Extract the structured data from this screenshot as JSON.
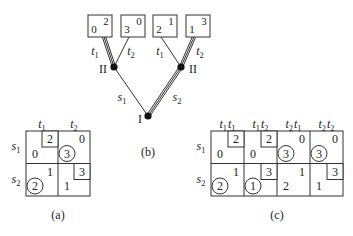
{
  "tree": {
    "caption": "(b)",
    "root": {
      "player": "I",
      "actions": [
        "s1",
        "s2"
      ],
      "chosen": "s2"
    },
    "nodes": [
      {
        "player": "II",
        "after": "s1",
        "actions": [
          "t1",
          "t2"
        ],
        "chosen": "t1",
        "payoffs": [
          {
            "p1": "0",
            "p2": "2"
          },
          {
            "p1": "3",
            "p2": "0"
          }
        ]
      },
      {
        "player": "II",
        "after": "s2",
        "actions": [
          "t1",
          "t2"
        ],
        "chosen": "t2",
        "payoffs": [
          {
            "p1": "2",
            "p2": "1"
          },
          {
            "p1": "1",
            "p2": "3"
          }
        ]
      }
    ]
  },
  "matrix_a": {
    "caption": "(a)",
    "col_headers": [
      "t1",
      "t2"
    ],
    "row_headers": [
      "s1",
      "s2"
    ],
    "cells": [
      [
        {
          "p1": "0",
          "p2": "2",
          "p1_circled": false,
          "p2_boxed": true
        },
        {
          "p1": "3",
          "p2": "0",
          "p1_circled": true,
          "p2_boxed": false
        }
      ],
      [
        {
          "p1": "2",
          "p2": "1",
          "p1_circled": true,
          "p2_boxed": false
        },
        {
          "p1": "1",
          "p2": "3",
          "p1_circled": false,
          "p2_boxed": true
        }
      ]
    ]
  },
  "matrix_c": {
    "caption": "(c)",
    "col_headers": [
      "t1t1",
      "t1t2",
      "t2t1",
      "t2t2"
    ],
    "row_headers": [
      "s1",
      "s2"
    ],
    "cells": [
      [
        {
          "p1": "0",
          "p2": "2",
          "p1_circled": false,
          "p2_boxed": true
        },
        {
          "p1": "0",
          "p2": "2",
          "p1_circled": false,
          "p2_boxed": true
        },
        {
          "p1": "3",
          "p2": "0",
          "p1_circled": true,
          "p2_boxed": false
        },
        {
          "p1": "3",
          "p2": "0",
          "p1_circled": true,
          "p2_boxed": false
        }
      ],
      [
        {
          "p1": "2",
          "p2": "1",
          "p1_circled": true,
          "p2_boxed": false
        },
        {
          "p1": "1",
          "p2": "3",
          "p1_circled": true,
          "p2_boxed": true
        },
        {
          "p1": "2",
          "p2": "1",
          "p1_circled": false,
          "p2_boxed": false
        },
        {
          "p1": "1",
          "p2": "3",
          "p1_circled": false,
          "p2_boxed": true
        }
      ]
    ]
  }
}
